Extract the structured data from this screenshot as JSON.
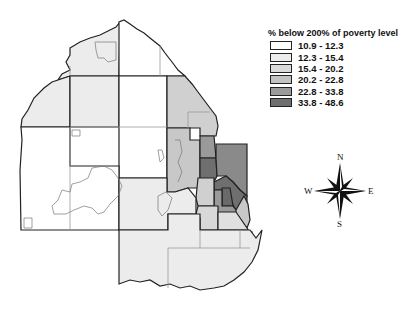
{
  "legend": {
    "title": "% below 200% of poverty level",
    "classes": [
      {
        "label": "10.9 - 12.3",
        "color": "#ffffff"
      },
      {
        "label": "12.3 - 15.4",
        "color": "#ececec"
      },
      {
        "label": "15.4 - 20.2",
        "color": "#dadada"
      },
      {
        "label": "20.2 - 22.8",
        "color": "#c3c3c3"
      },
      {
        "label": "22.8 - 33.8",
        "color": "#9a9a9a"
      },
      {
        "label": "33.8 - 48.6",
        "color": "#6f6f6f"
      }
    ]
  },
  "compass": {
    "n": "N",
    "s": "S",
    "e": "E",
    "w": "W"
  },
  "colors": {
    "outline": "#111111",
    "inner_border": "#9a9a9a"
  }
}
